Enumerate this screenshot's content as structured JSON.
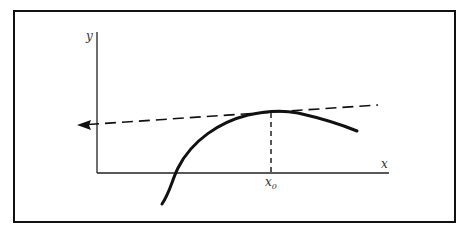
{
  "diagram": {
    "type": "tangent-line-at-local-maximum",
    "axes": {
      "x_label": "x",
      "y_label": "y"
    },
    "point_label": {
      "base": "x",
      "subscript": "0"
    },
    "elements": [
      {
        "name": "curve",
        "style": "solid-thick",
        "description": "concave-down curve rising to a peak near x0 then falling"
      },
      {
        "name": "tangent-line",
        "style": "dashed",
        "arrowhead": "left",
        "description": "nearly horizontal dashed line touching the curve near x0"
      },
      {
        "name": "drop-line",
        "style": "dashed",
        "description": "vertical dashed line from curve at x0 down to x-axis"
      }
    ],
    "colors": {
      "stroke": "#111111",
      "background": "#ffffff"
    }
  }
}
